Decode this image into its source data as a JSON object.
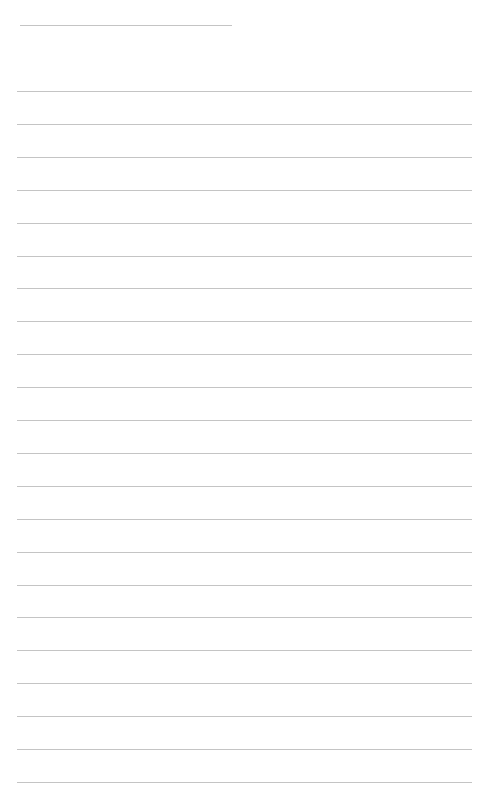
{
  "page": {
    "background": "#ffffff",
    "line_color": "#c4c4c4"
  },
  "header_line": {
    "x": 20,
    "y": 25,
    "width": 212
  },
  "ruled_lines": {
    "x": 17,
    "width": 455,
    "start_y": 91,
    "spacing": 32.9,
    "count": 22
  }
}
